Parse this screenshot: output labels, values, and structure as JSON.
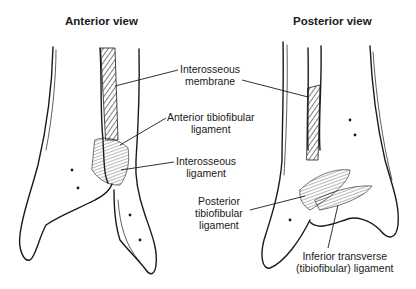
{
  "titles": {
    "anterior": "Anterior view",
    "posterior": "Posterior view"
  },
  "labels": {
    "interosseous_membrane": [
      "Interosseous",
      "membrane"
    ],
    "anterior_tibiofibular": [
      "Anterior tibiofibular",
      "ligament"
    ],
    "interosseous_ligament": [
      "Interosseous",
      "ligament"
    ],
    "posterior_tibiofibular": [
      "Posterior",
      "tibiofibular",
      "ligament"
    ],
    "inferior_transverse": [
      "Inferior transverse",
      "(tibiofibular) ligament"
    ]
  },
  "colors": {
    "ink": "#1a1a1a",
    "background": "#ffffff"
  }
}
